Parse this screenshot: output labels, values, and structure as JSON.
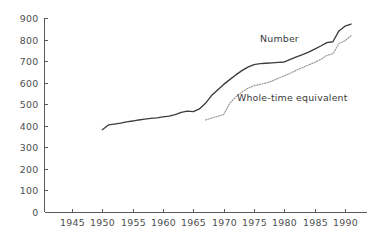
{
  "chart_data": {
    "type": "line",
    "title": "",
    "subtitle": "",
    "xlabel": "",
    "ylabel": "",
    "xlim": [
      1941,
      1992
    ],
    "ylim": [
      0,
      900
    ],
    "grid": false,
    "legend_position": "inline-annotation",
    "x_tick_labels": [
      "1945",
      "1950",
      "1955",
      "1960",
      "1965",
      "1970",
      "1975",
      "1980",
      "1985",
      "1990"
    ],
    "x_ticks": [
      1945,
      1950,
      1955,
      1960,
      1965,
      1970,
      1975,
      1980,
      1985,
      1990
    ],
    "y_tick_labels": [
      "0",
      "100",
      "200",
      "300",
      "400",
      "500",
      "600",
      "700",
      "800",
      "900"
    ],
    "y_ticks": [
      0,
      100,
      200,
      300,
      400,
      500,
      600,
      700,
      800,
      900
    ],
    "series": [
      {
        "name": "Number",
        "style": "solid",
        "color": "#3c3c3c",
        "label_x": 1976,
        "label_y": 790,
        "x": [
          1950,
          1951,
          1952,
          1953,
          1954,
          1955,
          1956,
          1957,
          1958,
          1959,
          1960,
          1961,
          1962,
          1963,
          1964,
          1965,
          1966,
          1967,
          1968,
          1969,
          1970,
          1971,
          1972,
          1973,
          1974,
          1975,
          1976,
          1977,
          1978,
          1979,
          1980,
          1981,
          1982,
          1983,
          1984,
          1985,
          1986,
          1987,
          1988,
          1989,
          1990,
          1991
        ],
        "y": [
          382,
          404,
          408,
          412,
          418,
          422,
          427,
          431,
          434,
          437,
          441,
          445,
          452,
          462,
          468,
          466,
          478,
          504,
          540,
          566,
          592,
          614,
          636,
          656,
          672,
          684,
          688,
          690,
          692,
          694,
          696,
          708,
          720,
          730,
          742,
          756,
          770,
          786,
          790,
          840,
          862,
          872
        ]
      },
      {
        "name": "Whole-time equivalent",
        "style": "dotted",
        "color": "#9a9a9a",
        "label_x": 1972.2,
        "label_y": 514,
        "x": [
          1967,
          1968,
          1969,
          1970,
          1971,
          1972,
          1973,
          1974,
          1975,
          1976,
          1977,
          1978,
          1979,
          1980,
          1981,
          1982,
          1983,
          1984,
          1985,
          1986,
          1987,
          1988,
          1989,
          1990,
          1991
        ],
        "y": [
          427,
          436,
          444,
          452,
          504,
          534,
          556,
          574,
          586,
          592,
          598,
          608,
          620,
          632,
          644,
          658,
          670,
          682,
          694,
          708,
          726,
          734,
          782,
          794,
          818
        ]
      }
    ]
  }
}
